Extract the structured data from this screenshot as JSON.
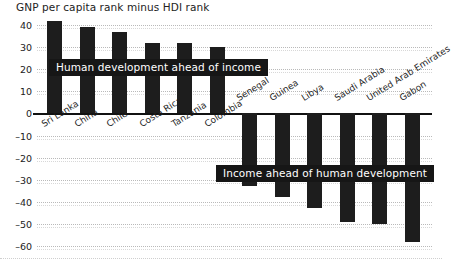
{
  "chart_data": {
    "type": "bar",
    "title": "GNP per capita rank minus HDI rank",
    "xlabel": "",
    "ylabel": "",
    "ylim": [
      -60,
      40
    ],
    "grid": true,
    "legend": "none",
    "yticks": [
      40,
      30,
      20,
      10,
      0,
      -10,
      -20,
      -30,
      -40,
      -50,
      -60
    ],
    "ytick_labels": [
      "40",
      "30",
      "20",
      "10",
      "0",
      "–10",
      "–20",
      "–30",
      "–40",
      "–50",
      "–60"
    ],
    "categories": [
      "Sri Lanka",
      "China",
      "Chile",
      "Costa Rica",
      "Tanzania",
      "Colombia",
      "Senegal",
      "Guinea",
      "Libya",
      "Saudi Arabia",
      "United Arab Emirates",
      "Gabon"
    ],
    "values": [
      42,
      39,
      37,
      32,
      32,
      30,
      -33,
      -38,
      -43,
      -49,
      -50,
      -58
    ],
    "annotations": [
      "Human development ahead of income",
      "Income ahead of human development"
    ],
    "bar_color": "#1d1d1d"
  },
  "labels": {
    "annotation_positive": "Human development ahead of income",
    "annotation_negative": "Income ahead of human development"
  }
}
